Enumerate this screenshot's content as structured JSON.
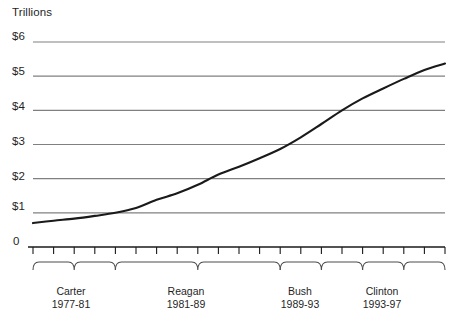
{
  "chart_data": {
    "type": "line",
    "title": "",
    "ylabel": "Trillions",
    "xlabel": "",
    "ylim": [
      0,
      6
    ],
    "xlim": [
      1977,
      1997
    ],
    "grid": true,
    "legend": false,
    "y_tick_labels": [
      "$6",
      "$5",
      "$4",
      "$3",
      "$2",
      "$1",
      "0"
    ],
    "y_tick_values": [
      6,
      5,
      4,
      3,
      2,
      1,
      0
    ],
    "x": [
      1977,
      1978,
      1979,
      1980,
      1981,
      1982,
      1983,
      1984,
      1985,
      1986,
      1987,
      1988,
      1989,
      1990,
      1991,
      1992,
      1993,
      1994,
      1995,
      1996,
      1997
    ],
    "values": [
      0.7,
      0.77,
      0.83,
      0.91,
      1.0,
      1.14,
      1.38,
      1.57,
      1.82,
      2.12,
      2.35,
      2.6,
      2.87,
      3.21,
      3.6,
      4.0,
      4.35,
      4.64,
      4.92,
      5.18,
      5.37
    ],
    "series": [
      {
        "name": "Gross federal debt",
        "color": "#1a1a1a",
        "values": [
          0.7,
          0.77,
          0.83,
          0.91,
          1.0,
          1.14,
          1.38,
          1.57,
          1.82,
          2.12,
          2.35,
          2.6,
          2.87,
          3.21,
          3.6,
          4.0,
          4.35,
          4.64,
          4.92,
          5.18,
          5.37
        ]
      }
    ],
    "eras": [
      {
        "name": "Carter",
        "years": "1977-81",
        "start": 1977,
        "end": 1981
      },
      {
        "name": "Reagan",
        "years": "1981-89",
        "start": 1981,
        "end": 1989
      },
      {
        "name": "Bush",
        "years": "1989-93",
        "start": 1989,
        "end": 1993
      },
      {
        "name": "Clinton",
        "years": "1993-97",
        "start": 1993,
        "end": 1997
      }
    ],
    "colors": {
      "line": "#1a1a1a",
      "gridline": "#808080",
      "axis": "#1a1a1a",
      "brace": "#4d4d4d",
      "text": "#1f1f1f"
    }
  }
}
